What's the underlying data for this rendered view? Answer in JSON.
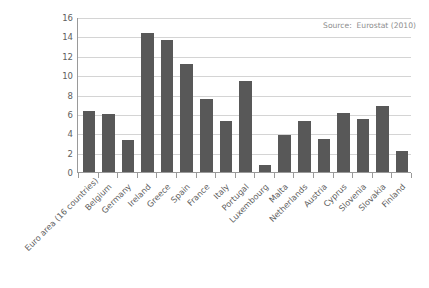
{
  "annotation": {
    "source_text": "Source:  Eurostat (2010)"
  },
  "chart_data": {
    "type": "bar",
    "title": "",
    "subtitle": "",
    "xlabel": "",
    "ylabel": "",
    "ylim": [
      0,
      16
    ],
    "ytick_step": 2,
    "yticks": [
      0,
      2,
      4,
      6,
      8,
      10,
      12,
      14,
      16
    ],
    "ytick_labels": [
      "0",
      "2",
      "4",
      "6",
      "8",
      "10",
      "12",
      "14",
      "16"
    ],
    "grid": "horizontal",
    "legend": "none",
    "bar_color": "#585858",
    "gridline_color": "#d4d4d4",
    "axis_color": "#9a9a9a",
    "categories": [
      "Euro area (16 countries)",
      "Belgium",
      "Germany",
      "Ireland",
      "Greece",
      "Spain",
      "France",
      "Italy",
      "Portugal",
      "Luxembourg",
      "Malta",
      "Netherlands",
      "Austria",
      "Cyprus",
      "Slovenia",
      "Slovakia",
      "Finland"
    ],
    "values": [
      6.3,
      6.0,
      3.3,
      14.3,
      13.6,
      11.2,
      7.5,
      5.3,
      9.4,
      0.7,
      3.8,
      5.3,
      3.4,
      6.1,
      5.5,
      6.8,
      2.2
    ],
    "annotations": [
      "Source:  Eurostat (2010)"
    ]
  }
}
